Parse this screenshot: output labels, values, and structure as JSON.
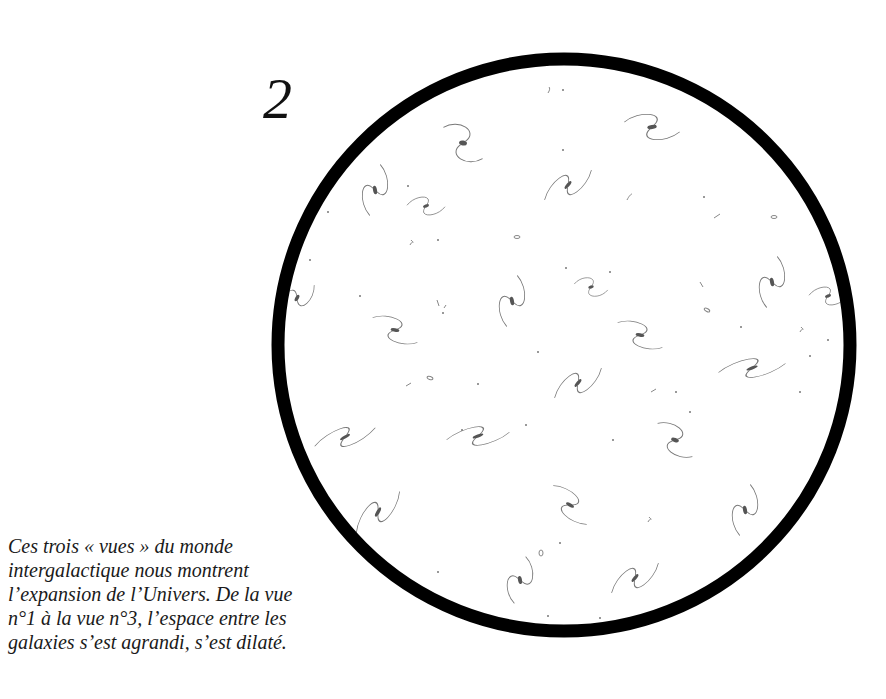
{
  "figure": {
    "view_number": "2",
    "circle": {
      "cx": 564,
      "cy": 345,
      "r": 286,
      "stroke_width": 13,
      "stroke_color": "#000000"
    },
    "galaxy_color": "#555555"
  },
  "caption": {
    "lines": [
      "Ces trois « vues » du monde",
      "intergalactique nous montrent",
      "l’expansion de l’Univers. De la vue",
      "n°1 à la vue n°3, l’espace entre les",
      "galaxies s’est agrandi, s’est dilaté."
    ]
  }
}
